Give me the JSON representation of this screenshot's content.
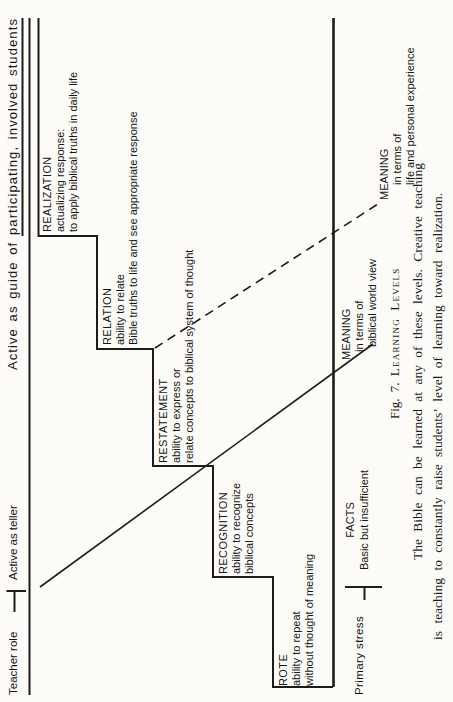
{
  "figure": {
    "teacher_axis": {
      "label": "Teacher role",
      "left_role": "Active as teller",
      "right_role": "Active as guide of participating, involved students"
    },
    "steps": [
      {
        "name": "ROTE",
        "line1": "ability to repeat",
        "line2": "without thought of meaning"
      },
      {
        "name": "RECOGNITION",
        "line1": "ability to recognize",
        "line2": "biblical concepts"
      },
      {
        "name": "RESTATEMENT",
        "line1": "ability to express or",
        "line2": "relate concepts to biblical system of thought"
      },
      {
        "name": "RELATION",
        "line1": "ability to relate",
        "line2": "Bible truths to life and see appropriate response"
      },
      {
        "name": "REALIZATION",
        "line1": "actualizing response:",
        "line2": "to apply biblical truths in daily life"
      }
    ],
    "stress_axis": {
      "label": "Primary stress",
      "levels": [
        {
          "name": "FACTS",
          "line1": "Basic but insufficient"
        },
        {
          "name": "MEANING",
          "line1": "in terms of",
          "line2": "biblical world view"
        },
        {
          "name": "MEANING",
          "line1": "in terms of",
          "line2": "life and personal experience"
        }
      ]
    },
    "caption": {
      "prefix": "Fig. 7.",
      "title": "Learning Levels"
    },
    "body": {
      "line1": "The Bible can be learned at any of these levels. Creative teaching",
      "line2": "is teaching to constantly raise students’ level of learning toward realization."
    }
  }
}
